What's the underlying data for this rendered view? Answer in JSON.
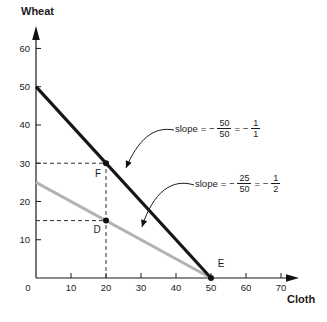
{
  "chart": {
    "ylabel": "Wheat",
    "xlabel": "Cloth"
  },
  "chart_data": {
    "type": "line",
    "title": "",
    "xlabel": "Cloth",
    "ylabel": "Wheat",
    "xlim": [
      0,
      75
    ],
    "ylim": [
      0,
      65
    ],
    "grid": false,
    "legend": "none",
    "x_ticks": [
      0,
      10,
      20,
      30,
      40,
      50,
      60,
      70
    ],
    "y_ticks": [
      10,
      20,
      30,
      40,
      50,
      60
    ],
    "series": [
      {
        "name": "line-slope-minus-1",
        "color": "#161616",
        "stroke_width": 3.2,
        "points": [
          [
            0,
            50
          ],
          [
            50,
            0
          ]
        ]
      },
      {
        "name": "line-slope-minus-half",
        "color": "#b3b3b3",
        "stroke_width": 3,
        "points": [
          [
            0,
            25
          ],
          [
            50,
            0
          ]
        ]
      }
    ],
    "markers": [
      {
        "label": "F",
        "x": 20,
        "y": 30
      },
      {
        "label": "D",
        "x": 20,
        "y": 15
      },
      {
        "label": "E",
        "x": 50,
        "y": 0
      }
    ],
    "guides": [
      {
        "from": [
          0,
          30
        ],
        "to": [
          20,
          30
        ]
      },
      {
        "from": [
          0,
          15
        ],
        "to": [
          20,
          15
        ]
      },
      {
        "from": [
          20,
          0
        ],
        "to": [
          20,
          30
        ]
      }
    ],
    "annotations": [
      {
        "label": "slope",
        "eq1": "= −",
        "num1": "50",
        "den1": "50",
        "eq2": "= −",
        "num2": "1",
        "den2": "1"
      },
      {
        "label": "slope",
        "eq1": "= −",
        "num1": "25",
        "den1": "50",
        "eq2": "= −",
        "num2": "1",
        "den2": "2"
      }
    ]
  }
}
